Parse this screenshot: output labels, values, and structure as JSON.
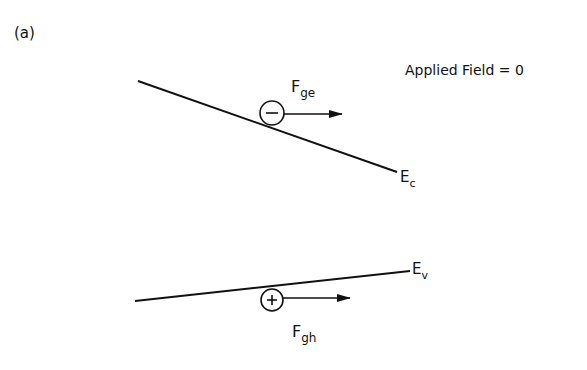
{
  "figure": {
    "panel_label": "(a)",
    "condition_label": "Applied Field = 0",
    "conduction_band": {
      "label_main": "E",
      "label_sub": "c"
    },
    "valence_band": {
      "label_main": "E",
      "label_sub": "v"
    },
    "electron": {
      "symbol": "−",
      "force_main": "F",
      "force_sub": "ge"
    },
    "hole": {
      "symbol": "+",
      "force_main": "F",
      "force_sub": "gh"
    }
  },
  "colors": {
    "line": "#111111",
    "background": "#ffffff"
  }
}
